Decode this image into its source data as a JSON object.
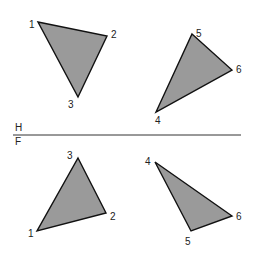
{
  "diagram": {
    "fold_line": {
      "upper_label": "H",
      "lower_label": "F",
      "x1": 13,
      "y1": 135,
      "x2": 241,
      "y2": 135
    },
    "views": [
      {
        "name": "top-view-triangle-123",
        "vertices": [
          {
            "label": "1",
            "x": 38,
            "y": 22,
            "lx": 29,
            "ly": 28
          },
          {
            "label": "2",
            "x": 107,
            "y": 36,
            "lx": 111,
            "ly": 38
          },
          {
            "label": "3",
            "x": 78,
            "y": 97,
            "lx": 68,
            "ly": 108
          }
        ]
      },
      {
        "name": "top-view-triangle-456",
        "vertices": [
          {
            "label": "5",
            "x": 192,
            "y": 34,
            "lx": 196,
            "ly": 37
          },
          {
            "label": "6",
            "x": 232,
            "y": 70,
            "lx": 236,
            "ly": 73
          },
          {
            "label": "4",
            "x": 156,
            "y": 112,
            "lx": 155,
            "ly": 124
          }
        ]
      },
      {
        "name": "front-view-triangle-123",
        "vertices": [
          {
            "label": "3",
            "x": 78,
            "y": 158,
            "lx": 67,
            "ly": 159
          },
          {
            "label": "2",
            "x": 106,
            "y": 213,
            "lx": 110,
            "ly": 220
          },
          {
            "label": "1",
            "x": 37,
            "y": 231,
            "lx": 28,
            "ly": 237
          }
        ]
      },
      {
        "name": "front-view-triangle-456",
        "vertices": [
          {
            "label": "4",
            "x": 155,
            "y": 162,
            "lx": 145,
            "ly": 165
          },
          {
            "label": "6",
            "x": 232,
            "y": 216,
            "lx": 236,
            "ly": 220
          },
          {
            "label": "5",
            "x": 191,
            "y": 231,
            "lx": 185,
            "ly": 245
          }
        ]
      }
    ],
    "colors": {
      "fill": "#9a9a9a",
      "stroke": "#111111",
      "background": "#ffffff"
    }
  }
}
